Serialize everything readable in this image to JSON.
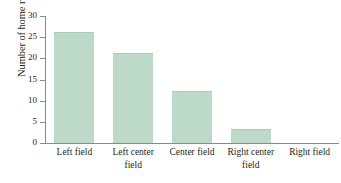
{
  "chart_data": {
    "type": "bar",
    "title": "",
    "subtitle": "",
    "xlabel": "",
    "ylabel": "Number of home runs hit",
    "categories": [
      "Left field",
      "Left center field",
      "Center field",
      "Right center field",
      "Right field"
    ],
    "category_lines": [
      [
        "Left field",
        ""
      ],
      [
        "Left center",
        "field"
      ],
      [
        "Center field",
        ""
      ],
      [
        "Right center",
        "field"
      ],
      [
        "Right field",
        ""
      ]
    ],
    "values": [
      26,
      21,
      12,
      3,
      0
    ],
    "ylim": [
      0,
      30
    ],
    "ytick_values": [
      0,
      5,
      10,
      15,
      20,
      25,
      30
    ],
    "ytick_labels": [
      "0",
      "5",
      "10",
      "15",
      "20",
      "25",
      "30"
    ],
    "grid": false,
    "legend": "none",
    "bar_color": "#bdd9c9",
    "bar_edge_color": "#a9ccb8",
    "axis_color": "#8a8a8a",
    "text_color": "#231f20",
    "background_color": "#ffffff"
  }
}
